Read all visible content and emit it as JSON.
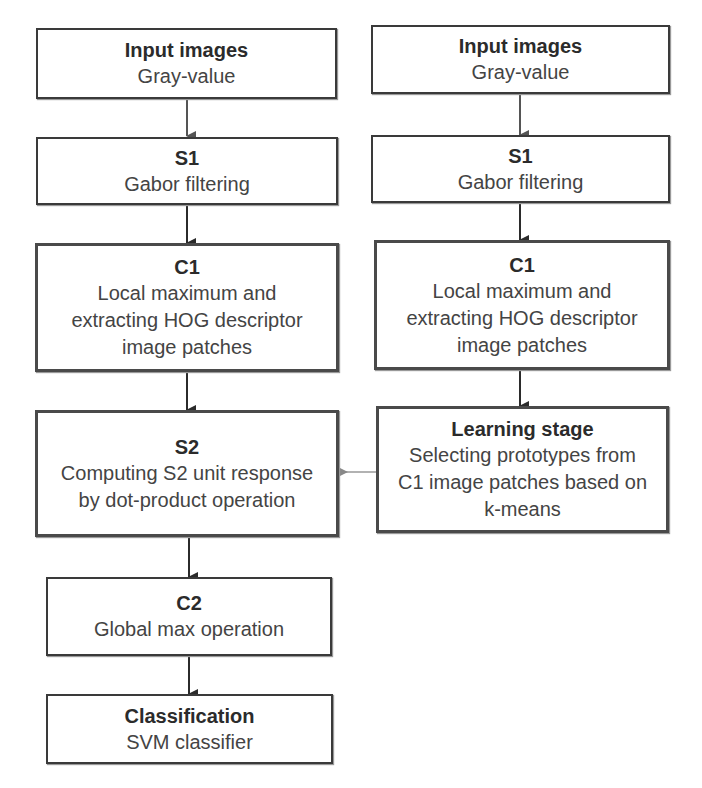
{
  "diagram": {
    "left_column": [
      {
        "id": "l-input",
        "title": "Input images",
        "lines": [
          "Gray-value"
        ]
      },
      {
        "id": "l-s1",
        "title": "S1",
        "lines": [
          "Gabor filtering"
        ]
      },
      {
        "id": "l-c1",
        "title": "C1",
        "lines": [
          "Local maximum and",
          "extracting HOG descriptor",
          "image patches"
        ]
      },
      {
        "id": "l-s2",
        "title": "S2",
        "lines": [
          "Computing S2 unit response",
          "by dot-product operation"
        ]
      },
      {
        "id": "l-c2",
        "title": "C2",
        "lines": [
          "Global max operation"
        ]
      },
      {
        "id": "l-class",
        "title": "Classification",
        "lines": [
          "SVM classifier"
        ]
      }
    ],
    "right_column": [
      {
        "id": "r-input",
        "title": "Input images",
        "lines": [
          "Gray-value"
        ]
      },
      {
        "id": "r-s1",
        "title": "S1",
        "lines": [
          "Gabor filtering"
        ]
      },
      {
        "id": "r-c1",
        "title": "C1",
        "lines": [
          "Local maximum and",
          "extracting HOG descriptor",
          "image patches"
        ]
      },
      {
        "id": "r-learn",
        "title": "Learning stage",
        "lines": [
          "Selecting prototypes from",
          "C1 image patches based on",
          "k-means"
        ]
      }
    ],
    "edges": [
      {
        "from": "l-input",
        "to": "l-s1"
      },
      {
        "from": "l-s1",
        "to": "l-c1"
      },
      {
        "from": "l-c1",
        "to": "l-s2"
      },
      {
        "from": "l-s2",
        "to": "l-c2"
      },
      {
        "from": "l-c2",
        "to": "l-class"
      },
      {
        "from": "r-input",
        "to": "r-s1"
      },
      {
        "from": "r-s1",
        "to": "r-c1"
      },
      {
        "from": "r-c1",
        "to": "r-learn"
      },
      {
        "from": "r-learn",
        "to": "l-s2"
      }
    ],
    "colors": {
      "border": "#3a3a3a",
      "arrow": "#2b2b2b",
      "arrow_light": "#888888",
      "text": "#444444"
    }
  }
}
